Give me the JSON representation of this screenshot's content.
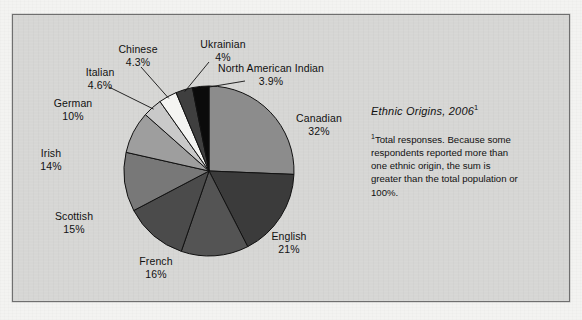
{
  "figure": {
    "background_color": "#d6d6d4",
    "border_color": "#6f6f6f"
  },
  "caption": {
    "title": "Ethnic Origins, 2006",
    "title_superscript": "1",
    "footnote_marker": "1",
    "footnote": "Total responses. Because some respondents reported more than one ethnic origin, the sum is greater than the total population or 100%."
  },
  "chart_data": {
    "type": "pie",
    "title": "Ethnic Origins, 2006",
    "xlabel": "",
    "ylabel": "",
    "legend": "none",
    "grid": false,
    "note": "Total responses. Because some respondents reported more than one ethnic origin, the sum is greater than the total population or 100%.",
    "start_angle_deg": 0,
    "direction": "clockwise",
    "categories": [
      "Canadian",
      "English",
      "French",
      "Scottish",
      "Irish",
      "German",
      "Italian",
      "Chinese",
      "Ukrainian",
      "North American Indian"
    ],
    "values": [
      32,
      21,
      16,
      15,
      14,
      10,
      4.6,
      4.3,
      4,
      3.9
    ],
    "value_labels": [
      "32%",
      "21%",
      "16%",
      "15%",
      "14%",
      "10%",
      "4.6%",
      "4.3%",
      "4%",
      "3.9%"
    ],
    "colors": [
      "#8c8c8c",
      "#3b3b3b",
      "#545454",
      "#4b4b4b",
      "#787878",
      "#9e9e9e",
      "#c9c9c9",
      "#f4f4f2",
      "#3f3f3f",
      "#0b0b0b"
    ],
    "slices": [
      {
        "label": "Canadian",
        "value": 32,
        "value_label": "32%",
        "color": "#8c8c8c",
        "leader": false
      },
      {
        "label": "English",
        "value": 21,
        "value_label": "21%",
        "color": "#3b3b3b",
        "leader": false
      },
      {
        "label": "French",
        "value": 16,
        "value_label": "16%",
        "color": "#545454",
        "leader": false
      },
      {
        "label": "Scottish",
        "value": 15,
        "value_label": "15%",
        "color": "#4b4b4b",
        "leader": false
      },
      {
        "label": "Irish",
        "value": 14,
        "value_label": "14%",
        "color": "#787878",
        "leader": false
      },
      {
        "label": "German",
        "value": 10,
        "value_label": "10%",
        "color": "#9e9e9e",
        "leader": false
      },
      {
        "label": "Italian",
        "value": 4.6,
        "value_label": "4.6%",
        "color": "#c9c9c9",
        "leader": true
      },
      {
        "label": "Chinese",
        "value": 4.3,
        "value_label": "4.3%",
        "color": "#f4f4f2",
        "leader": true
      },
      {
        "label": "Ukrainian",
        "value": 4,
        "value_label": "4%",
        "color": "#3f3f3f",
        "leader": true
      },
      {
        "label": "North American Indian",
        "value": 3.9,
        "value_label": "3.9%",
        "color": "#0b0b0b",
        "leader": true
      }
    ]
  }
}
